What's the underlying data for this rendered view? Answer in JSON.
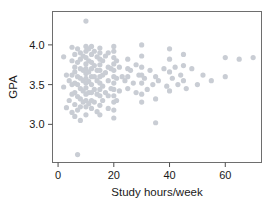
{
  "chart_data": {
    "type": "scatter",
    "title": "",
    "xlabel": "Study hours/week",
    "ylabel": "GPA",
    "xlim": [
      -2,
      73
    ],
    "ylim": [
      2.52,
      4.42
    ],
    "xticks": [
      0,
      20,
      40,
      60
    ],
    "xtick_labels": [
      "0",
      "20",
      "40",
      "60"
    ],
    "yticks": [
      3.0,
      3.5,
      4.0
    ],
    "ytick_labels": [
      "3.0",
      "3.5",
      "4.0"
    ],
    "grid": false,
    "legend": null,
    "marker": "circle",
    "marker_color": "#c9cdd4",
    "marker_size": 2.6,
    "n_points": 168,
    "x": [
      2,
      2,
      3,
      3,
      4,
      4,
      5,
      5,
      5,
      5,
      5,
      5,
      6,
      6,
      6,
      6,
      6,
      6,
      6,
      7,
      7,
      7,
      7,
      7,
      7,
      7,
      8,
      8,
      8,
      8,
      8,
      8,
      8,
      8,
      9,
      9,
      9,
      9,
      9,
      10,
      10,
      10,
      10,
      10,
      10,
      10,
      10,
      10,
      10,
      10,
      10,
      10,
      10,
      11,
      11,
      11,
      11,
      11,
      11,
      12,
      12,
      12,
      12,
      12,
      12,
      12,
      12,
      12,
      13,
      13,
      13,
      13,
      13,
      14,
      14,
      14,
      14,
      14,
      15,
      15,
      15,
      15,
      15,
      15,
      15,
      15,
      15,
      15,
      15,
      16,
      16,
      16,
      16,
      17,
      17,
      17,
      18,
      18,
      18,
      18,
      18,
      19,
      19,
      20,
      20,
      20,
      20,
      20,
      20,
      20,
      20,
      20,
      20,
      20,
      20,
      21,
      21,
      21,
      22,
      22,
      23,
      24,
      25,
      25,
      25,
      25,
      26,
      27,
      28,
      28,
      29,
      30,
      30,
      30,
      30,
      30,
      30,
      30,
      31,
      32,
      33,
      34,
      35,
      35,
      35,
      36,
      38,
      39,
      40,
      40,
      40,
      40,
      41,
      42,
      43,
      44,
      45,
      45,
      45,
      46,
      48,
      50,
      52,
      55,
      60,
      60,
      65,
      70
    ],
    "y": [
      3.85,
      3.47,
      3.62,
      3.21,
      3.55,
      3.3,
      3.97,
      3.8,
      3.62,
      3.5,
      3.38,
      3.15,
      3.88,
      3.72,
      3.66,
      3.52,
      3.4,
      3.25,
      3.1,
      3.95,
      3.78,
      3.6,
      3.5,
      3.35,
      3.18,
      2.62,
      3.9,
      3.82,
      3.7,
      3.58,
      3.45,
      3.32,
      3.22,
      3.05,
      3.86,
      3.68,
      3.55,
      3.42,
      3.28,
      4.3,
      3.98,
      3.92,
      3.84,
      3.76,
      3.7,
      3.64,
      3.58,
      3.52,
      3.46,
      3.38,
      3.3,
      3.22,
      3.12,
      3.95,
      3.8,
      3.66,
      3.54,
      3.4,
      3.26,
      3.98,
      3.88,
      3.78,
      3.7,
      3.6,
      3.5,
      3.4,
      3.3,
      3.2,
      3.92,
      3.74,
      3.6,
      3.44,
      3.28,
      3.85,
      3.68,
      3.55,
      3.38,
      3.16,
      3.96,
      3.9,
      3.82,
      3.75,
      3.68,
      3.6,
      3.52,
      3.44,
      3.36,
      3.24,
      3.12,
      3.8,
      3.62,
      3.48,
      3.3,
      3.86,
      3.65,
      3.4,
      3.9,
      3.72,
      3.55,
      3.36,
      3.2,
      3.7,
      3.45,
      3.98,
      3.92,
      3.84,
      3.76,
      3.68,
      3.6,
      3.52,
      3.44,
      3.36,
      3.28,
      3.18,
      3.08,
      3.8,
      3.58,
      3.3,
      3.72,
      3.42,
      3.6,
      3.55,
      3.82,
      3.7,
      3.6,
      3.45,
      3.68,
      3.52,
      3.75,
      3.4,
      3.62,
      4.0,
      3.86,
      3.72,
      3.62,
      3.52,
      3.38,
      3.28,
      3.58,
      3.44,
      3.68,
      3.5,
      3.6,
      3.32,
      3.02,
      3.55,
      3.7,
      3.48,
      3.95,
      3.82,
      3.66,
      3.42,
      3.58,
      3.72,
      3.5,
      3.62,
      3.88,
      3.74,
      3.55,
      3.45,
      3.7,
      3.5,
      3.62,
      3.55,
      3.84,
      3.6,
      3.82,
      3.84
    ]
  }
}
